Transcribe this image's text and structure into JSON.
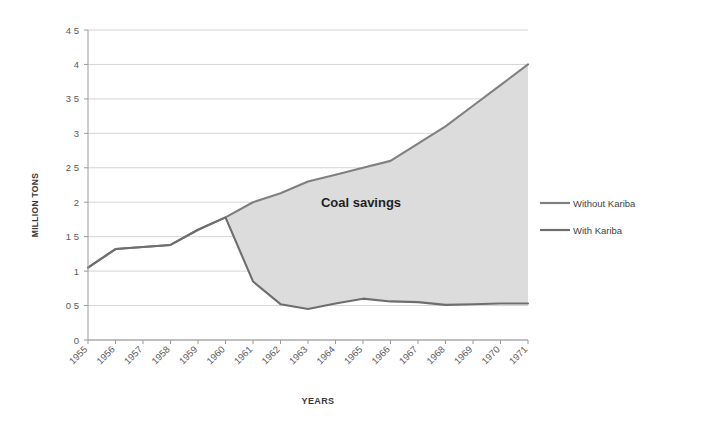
{
  "chart_data": {
    "type": "line",
    "title": "",
    "xlabel": "YEARS",
    "ylabel": "MILLION TONS",
    "categories": [
      "1955",
      "1956",
      "1957",
      "1958",
      "1959",
      "1960",
      "1961",
      "1962",
      "1963",
      "1964",
      "1965",
      "1966",
      "1967",
      "1968",
      "1969",
      "1970",
      "1971"
    ],
    "series": [
      {
        "name": "Without Kariba",
        "color": "#808080",
        "values": [
          1.05,
          1.32,
          1.35,
          1.38,
          1.6,
          1.78,
          2.0,
          2.13,
          2.3,
          2.4,
          2.5,
          2.6,
          2.85,
          3.1,
          3.4,
          3.7,
          4.0
        ]
      },
      {
        "name": "With Kariba",
        "color": "#6e6e6e",
        "values": [
          1.05,
          1.32,
          1.35,
          1.38,
          1.6,
          1.78,
          0.85,
          0.52,
          0.45,
          0.53,
          0.6,
          0.56,
          0.55,
          0.51,
          0.52,
          0.53,
          0.53
        ]
      }
    ],
    "ylim": [
      0,
      4.5
    ],
    "yticks": [
      "0",
      "0 5",
      "1",
      "1 5",
      "2",
      "2 5",
      "3",
      "3 5",
      "4",
      "4 5"
    ],
    "ytick_values": [
      0,
      0.5,
      1,
      1.5,
      2,
      2.5,
      3,
      3.5,
      4,
      4.5
    ],
    "grid": true,
    "legend_position": "right",
    "annotations": [
      {
        "text": "Coal savings",
        "x": "1965",
        "y": 2.0
      }
    ],
    "shaded_region": {
      "label": "Coal savings",
      "fill": "#dcdcdc",
      "between": [
        "Without Kariba",
        "With Kariba"
      ],
      "from_category": "1960",
      "to_category": "1971"
    }
  }
}
